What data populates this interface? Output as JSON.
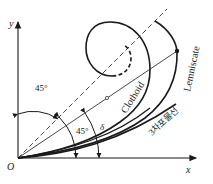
{
  "diagram": {
    "type": "transition-curves-comparison",
    "axes": {
      "origin_label": "O",
      "x_label": "x",
      "y_label": "y"
    },
    "angles": {
      "upper_label": "45°",
      "lower_label": "45°",
      "delta_label": "δ"
    },
    "curves": [
      {
        "name": "Clothoid",
        "label": "Clothoid",
        "style": "spiral"
      },
      {
        "name": "Lemniscate",
        "label": "Lemniscate",
        "style": "arc"
      },
      {
        "name": "Cubic parabola",
        "label": "3차포물선",
        "style": "curve"
      }
    ],
    "markers": {
      "lemniscate_point": "filled-dot",
      "midpoint": "open-circle"
    },
    "colors": {
      "line": "#1a1a1a",
      "background": "#ffffff"
    }
  }
}
